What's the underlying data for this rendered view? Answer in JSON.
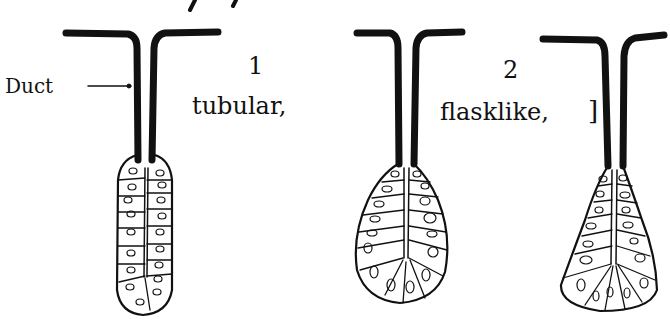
{
  "diagram": {
    "type": "gland-types",
    "labels": {
      "duct": "Duct",
      "num1": "1",
      "type1": "tubular,",
      "num2": "2",
      "type2": "flasklike,",
      "bracket": "]"
    },
    "glands": [
      {
        "name": "tubular",
        "shape": "elongated tube"
      },
      {
        "name": "flasklike",
        "shape": "round flask"
      },
      {
        "name": "flasklike-variant",
        "shape": "conical flask"
      }
    ],
    "colors": {
      "ink": "#111111",
      "background": "#ffffff"
    }
  }
}
